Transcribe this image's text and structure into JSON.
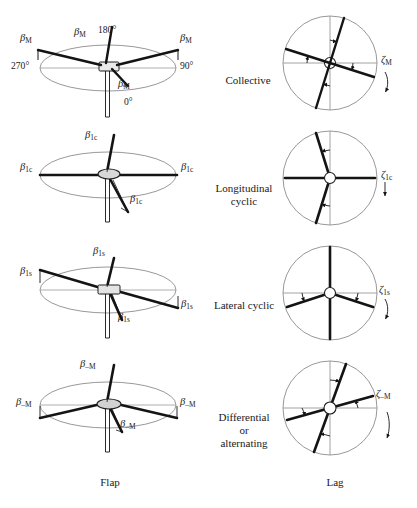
{
  "figure": {
    "type": "rotor-blade-mode-diagram",
    "columns": [
      {
        "id": "flap",
        "title": "Flap"
      },
      {
        "id": "lag",
        "title": "Lag"
      }
    ],
    "rows": [
      {
        "id": "collective",
        "mode_label": "Collective",
        "flap_symbol": "β",
        "flap_subscript": "M",
        "lag_symbol": "ζ",
        "lag_subscript": "M",
        "azimuth_labels": [
          "180°",
          "90°",
          "0°",
          "270°"
        ]
      },
      {
        "id": "longitudinal-cyclic",
        "mode_label": "Longitudinal\ncyclic",
        "mode_line1": "Longitudinal",
        "mode_line2": "cyclic",
        "flap_symbol": "β",
        "flap_subscript": "1c",
        "lag_symbol": "ζ",
        "lag_subscript": "1c"
      },
      {
        "id": "lateral-cyclic",
        "mode_label": "Lateral cyclic",
        "mode_line1": "Lateral cyclic",
        "flap_symbol": "β",
        "flap_subscript": "1s",
        "lag_symbol": "ζ",
        "lag_subscript": "1s"
      },
      {
        "id": "differential-alternating",
        "mode_label": "Differential or alternating",
        "mode_line1": "Differential",
        "mode_line2": "or",
        "mode_line3": "alternating",
        "flap_symbol": "β",
        "flap_subscript": "–M",
        "lag_symbol": "ζ",
        "lag_subscript": "–M"
      }
    ],
    "colors": {
      "background": "#ffffff",
      "blade": "#141414",
      "outline": "#6b6b6b",
      "axis": "#8a8a8a",
      "text": "#1a1a1a"
    }
  }
}
